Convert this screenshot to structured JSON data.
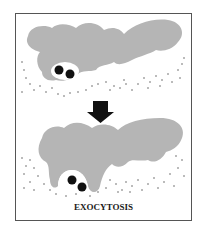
{
  "diagram": {
    "caption": "EXOCYTOSIS",
    "colors": {
      "cell": "#b5b5b5",
      "vesicle": "#ffffff",
      "particle": "#111111",
      "dots": "#444444",
      "arrow": "#111111",
      "border": "#555555"
    },
    "panels": [
      {
        "name": "before",
        "description": "Cell with vesicle containing two particles near membrane"
      },
      {
        "name": "after",
        "description": "Vesicle fused with membrane releasing particles outside"
      }
    ]
  }
}
